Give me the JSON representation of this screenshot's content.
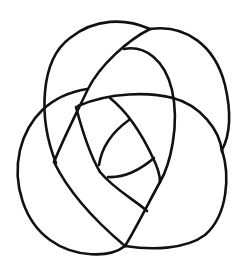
{
  "diagram": {
    "type": "knot-diagram",
    "background": "#ffffff",
    "stroke_color": "#111111",
    "stroke_width": 2.6,
    "width": 242,
    "height": 277,
    "strands": [
      {
        "name": "top-left-arc",
        "d": "M 56 163 C 38 118, 40 60, 70 38 C 95 18, 125 18, 150 29"
      },
      {
        "name": "right-outer-arc",
        "d": "M 150 29 C 185 24, 215 45, 225 85 C 232 115, 230 135, 222 150"
      },
      {
        "name": "right-outer-to-bottom",
        "d": "M 222 150 C 230 175, 228 215, 205 235 C 185 250, 150 250, 125 246"
      },
      {
        "name": "bottom-left-arc",
        "d": "M 125 246 C 110 258, 75 258, 50 240 C 25 222, 12 185, 20 150 C 28 118, 50 95, 87 89"
      },
      {
        "name": "diagonal-upper",
        "d": "M 150 29 C 128 40, 100 65, 88 89 C 78 110, 65 135, 54 162"
      },
      {
        "name": "inner-top-arc",
        "d": "M 124 49 C 145 45, 165 60, 172 90 C 180 125, 170 165, 160 182"
      },
      {
        "name": "middle-horizontal-arc",
        "d": "M 78 106 C 110 92, 150 92, 173 98 C 200 105, 220 130, 222 152"
      },
      {
        "name": "left-inner-strand",
        "d": "M 76 107 C 82 130, 90 155, 100 172 C 115 190, 135 200, 147 211"
      },
      {
        "name": "lower-diagonal",
        "d": "M 54 162 C 70 195, 100 225, 125 246"
      },
      {
        "name": "bottom-up-strand",
        "d": "M 125 246 C 135 230, 150 200, 160 182"
      },
      {
        "name": "inner-spoke",
        "d": "M 110 98 C 125 110, 140 130, 153 158 C 158 168, 160 178, 160 182"
      },
      {
        "name": "inner-lens-upper",
        "d": "M 129 120 C 115 130, 102 145, 99 165"
      },
      {
        "name": "inner-lens-lower",
        "d": "M 108 177 C 125 178, 140 170, 154 158"
      }
    ]
  }
}
